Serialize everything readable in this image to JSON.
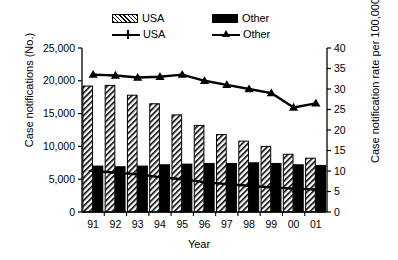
{
  "chart_data": {
    "type": "bar",
    "title": "",
    "subtitle": "",
    "xlabel": "Year",
    "ylabel": "Case notifications (No.)",
    "y2label": "Case notification rate per 100,000 p.a.",
    "categories": [
      "91",
      "92",
      "93",
      "94",
      "95",
      "96",
      "97",
      "98",
      "99",
      "00",
      "01"
    ],
    "ylim": [
      0,
      25000
    ],
    "y2lim": [
      0,
      40
    ],
    "yticks": [
      "0",
      "5,000",
      "10,000",
      "15,000",
      "20,000",
      "25,000"
    ],
    "ytick_values": [
      0,
      5000,
      10000,
      15000,
      20000,
      25000
    ],
    "y2ticks": [
      "0",
      "5",
      "10",
      "15",
      "20",
      "25",
      "30",
      "35",
      "40"
    ],
    "y2tick_values": [
      0,
      5,
      10,
      15,
      20,
      25,
      30,
      35,
      40
    ],
    "grid": false,
    "legend_position": "top",
    "series": [
      {
        "name": "USA",
        "kind": "bar",
        "axis": "left",
        "style": "hatched",
        "color": "#000000",
        "values": [
          19200,
          19300,
          17800,
          16500,
          14800,
          13200,
          11800,
          10800,
          10000,
          8800,
          8200
        ]
      },
      {
        "name": "Other",
        "kind": "bar",
        "axis": "left",
        "style": "solid",
        "color": "#000000",
        "values": [
          7000,
          6900,
          7000,
          7200,
          7300,
          7400,
          7400,
          7500,
          7400,
          7200,
          7100
        ]
      },
      {
        "name": "USA",
        "kind": "line",
        "axis": "right",
        "marker": "cross",
        "color": "#000000",
        "values": [
          10.0,
          9.6,
          9.2,
          8.5,
          8.0,
          7.3,
          6.8,
          6.4,
          6.0,
          5.7,
          5.5
        ]
      },
      {
        "name": "Other",
        "kind": "line",
        "axis": "right",
        "marker": "triangle",
        "color": "#000000",
        "values": [
          33.5,
          33.3,
          32.8,
          33.0,
          33.5,
          32.0,
          31.0,
          30.0,
          29.0,
          25.5,
          26.5
        ]
      }
    ]
  },
  "legend": {
    "entries": [
      {
        "label": "USA",
        "kind": "bar",
        "style": "hatched"
      },
      {
        "label": "Other",
        "kind": "bar",
        "style": "solid"
      },
      {
        "label": "USA",
        "kind": "line",
        "marker": "cross"
      },
      {
        "label": "Other",
        "kind": "line",
        "marker": "triangle"
      }
    ]
  }
}
